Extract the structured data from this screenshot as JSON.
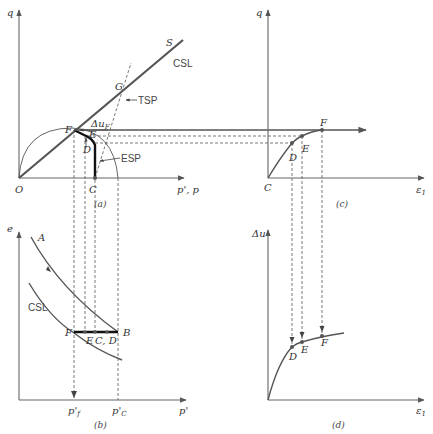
{
  "figure": {
    "panels": [
      {
        "id": "a",
        "caption": "(a)",
        "x_axis_label": "p', p",
        "y_axis_label": "q",
        "origin_label": "O",
        "line_labels": {
          "csl_end": "S",
          "csl": "CSL",
          "tsp": "TSP",
          "esp": "ESP",
          "delta_u": "Δu",
          "delta_u_sub": "F"
        },
        "points": [
          "O",
          "C",
          "D",
          "E",
          "F",
          "G"
        ]
      },
      {
        "id": "b",
        "caption": "(b)",
        "x_axis_label": "p'",
        "y_axis_label": "e",
        "curve_labels": {
          "a_curve": "A",
          "csl": "CSL"
        },
        "points": [
          "F",
          "E",
          "C, D",
          "B"
        ],
        "tick_labels": {
          "pf": "p'",
          "pf_sub": "f",
          "pc": "p'",
          "pc_sub": "C"
        }
      },
      {
        "id": "c",
        "caption": "(c)",
        "x_axis_label": "ε",
        "x_axis_sub": "1",
        "y_axis_label": "q",
        "origin_label": "C",
        "points": [
          "D",
          "E",
          "F"
        ]
      },
      {
        "id": "d",
        "caption": "(d)",
        "x_axis_label": "ε",
        "x_axis_sub": "1",
        "y_axis_label": "Δu",
        "points": [
          "D",
          "E",
          "F"
        ]
      }
    ]
  },
  "labels": {
    "a_q": "q",
    "a_O": "O",
    "a_C": "C",
    "a_D": "D",
    "a_E": "E",
    "a_F": "F",
    "a_G": "G",
    "a_S": "S",
    "a_CSL": "CSL",
    "a_TSP": "TSP",
    "a_ESP": "ESP",
    "a_du": "Δu",
    "a_du_sub": "F",
    "a_x": "p', p",
    "a_cap": "(a)",
    "b_e": "e",
    "b_A": "A",
    "b_CSL": "CSL",
    "b_F": "F",
    "b_E": "E",
    "b_CD": "C, D",
    "b_B": "B",
    "b_pf": "p'",
    "b_pf_sub": "f",
    "b_pc": "p'",
    "b_pc_sub": "C",
    "b_x": "p'",
    "b_cap": "(b)",
    "c_q": "q",
    "c_C": "C",
    "c_D": "D",
    "c_E": "E",
    "c_F": "F",
    "c_x": "ε",
    "c_x_sub": "1",
    "c_cap": "(c)",
    "d_du": "Δu",
    "d_D": "D",
    "d_E": "E",
    "d_F": "F",
    "d_x": "ε",
    "d_x_sub": "1",
    "d_cap": "(d)"
  }
}
